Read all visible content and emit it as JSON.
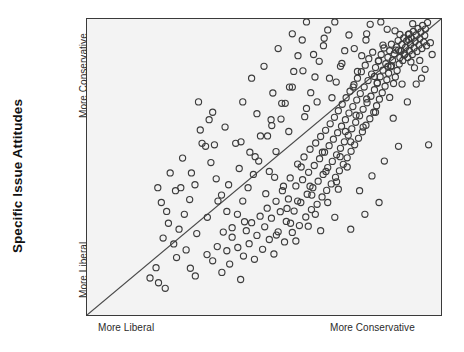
{
  "figure": {
    "background_color": "#ffffff",
    "plot_background_color": "#f3f3f3",
    "frame_color": "#3a3a3a"
  },
  "axes": {
    "y_title": "Specific Issue Attitudes",
    "y_tick_high": "More Conservative",
    "y_tick_low": "More Liberal",
    "x_tick_low": "More Liberal",
    "x_tick_high": "More Conservative"
  },
  "chart_data": {
    "type": "scatter",
    "title": "",
    "xlabel": "",
    "ylabel": "Specific Issue Attitudes",
    "xlim": [
      0,
      100
    ],
    "ylim": [
      0,
      100
    ],
    "grid": false,
    "legend": null,
    "xtick_labels": [
      "More Liberal",
      "More Conservative"
    ],
    "ytick_labels": [
      "More Liberal",
      "More Conservative"
    ],
    "marker": {
      "shape": "circle-open",
      "size_px": 6.2,
      "edge_color": "#3c3c3c",
      "face_color": "none",
      "edge_width_px": 1.15
    },
    "reference_line": {
      "name": "identity-diagonal",
      "x": [
        0,
        100
      ],
      "y": [
        0,
        100
      ],
      "color": "#4a4a4a",
      "width_px": 1.2,
      "style": "solid"
    },
    "annotations": [],
    "points": [
      [
        20.2,
        10.9
      ],
      [
        22.1,
        9.0
      ],
      [
        25.3,
        19.4
      ],
      [
        29.2,
        15.8
      ],
      [
        30.6,
        13.2
      ],
      [
        33.9,
        20.4
      ],
      [
        35.5,
        18.3
      ],
      [
        36.8,
        23.1
      ],
      [
        38.1,
        14.4
      ],
      [
        39.5,
        21.7
      ],
      [
        40.3,
        17.2
      ],
      [
        41.0,
        26.3
      ],
      [
        42.6,
        22.8
      ],
      [
        43.4,
        12.0
      ],
      [
        44.2,
        19.9
      ],
      [
        45.0,
        28.5
      ],
      [
        45.8,
        24.1
      ],
      [
        46.5,
        31.2
      ],
      [
        47.3,
        18.8
      ],
      [
        48.0,
        26.9
      ],
      [
        48.9,
        33.4
      ],
      [
        49.6,
        22.2
      ],
      [
        50.2,
        29.8
      ],
      [
        50.9,
        36.1
      ],
      [
        51.5,
        25.5
      ],
      [
        52.1,
        32.7
      ],
      [
        52.8,
        20.6
      ],
      [
        53.4,
        38.4
      ],
      [
        54.0,
        28.1
      ],
      [
        54.6,
        34.9
      ],
      [
        55.2,
        42.0
      ],
      [
        55.8,
        24.7
      ],
      [
        56.3,
        31.6
      ],
      [
        56.9,
        39.2
      ],
      [
        57.4,
        46.3
      ],
      [
        58.0,
        27.9
      ],
      [
        58.5,
        35.1
      ],
      [
        59.0,
        43.6
      ],
      [
        59.5,
        51.0
      ],
      [
        60.0,
        30.2
      ],
      [
        60.4,
        38.0
      ],
      [
        60.9,
        45.7
      ],
      [
        61.3,
        53.4
      ],
      [
        61.8,
        33.1
      ],
      [
        62.2,
        40.8
      ],
      [
        62.6,
        48.2
      ],
      [
        63.0,
        56.0
      ],
      [
        63.4,
        35.6
      ],
      [
        63.8,
        43.0
      ],
      [
        64.2,
        50.5
      ],
      [
        64.6,
        58.1
      ],
      [
        65.0,
        37.4
      ],
      [
        65.3,
        45.2
      ],
      [
        65.7,
        52.8
      ],
      [
        66.0,
        60.3
      ],
      [
        66.4,
        39.9
      ],
      [
        66.7,
        47.5
      ],
      [
        67.1,
        55.0
      ],
      [
        67.4,
        62.4
      ],
      [
        67.7,
        42.1
      ],
      [
        68.0,
        49.8
      ],
      [
        68.4,
        57.2
      ],
      [
        68.7,
        64.6
      ],
      [
        69.0,
        44.3
      ],
      [
        69.3,
        51.9
      ],
      [
        69.6,
        59.4
      ],
      [
        69.9,
        66.8
      ],
      [
        70.2,
        46.5
      ],
      [
        70.5,
        54.1
      ],
      [
        70.8,
        61.6
      ],
      [
        71.0,
        69.0
      ],
      [
        71.3,
        48.7
      ],
      [
        71.6,
        56.3
      ],
      [
        71.9,
        63.8
      ],
      [
        72.1,
        71.2
      ],
      [
        72.4,
        50.9
      ],
      [
        72.7,
        58.5
      ],
      [
        73.0,
        66.0
      ],
      [
        73.2,
        73.4
      ],
      [
        73.5,
        53.1
      ],
      [
        73.8,
        60.7
      ],
      [
        74.0,
        68.2
      ],
      [
        74.3,
        75.6
      ],
      [
        74.6,
        55.3
      ],
      [
        74.8,
        62.9
      ],
      [
        75.1,
        70.4
      ],
      [
        75.4,
        77.8
      ],
      [
        75.6,
        57.5
      ],
      [
        75.9,
        65.1
      ],
      [
        76.2,
        72.6
      ],
      [
        76.4,
        80.0
      ],
      [
        76.7,
        59.7
      ],
      [
        77.0,
        67.3
      ],
      [
        77.2,
        74.8
      ],
      [
        77.5,
        82.2
      ],
      [
        77.8,
        61.9
      ],
      [
        78.0,
        69.5
      ],
      [
        78.3,
        77.0
      ],
      [
        78.6,
        84.4
      ],
      [
        78.8,
        64.1
      ],
      [
        79.1,
        71.7
      ],
      [
        79.4,
        79.2
      ],
      [
        79.6,
        86.6
      ],
      [
        79.9,
        66.3
      ],
      [
        80.2,
        73.9
      ],
      [
        80.4,
        81.4
      ],
      [
        80.7,
        88.8
      ],
      [
        81.0,
        68.5
      ],
      [
        81.2,
        76.1
      ],
      [
        81.5,
        83.6
      ],
      [
        81.8,
        70.7
      ],
      [
        82.0,
        78.3
      ],
      [
        82.3,
        85.8
      ],
      [
        82.6,
        72.9
      ],
      [
        82.8,
        80.5
      ],
      [
        83.1,
        88.0
      ],
      [
        83.4,
        75.1
      ],
      [
        83.6,
        82.7
      ],
      [
        83.9,
        90.2
      ],
      [
        84.2,
        77.3
      ],
      [
        84.4,
        84.9
      ],
      [
        84.7,
        79.5
      ],
      [
        85.0,
        87.1
      ],
      [
        85.2,
        81.7
      ],
      [
        85.5,
        89.3
      ],
      [
        85.8,
        83.9
      ],
      [
        86.0,
        91.5
      ],
      [
        86.3,
        86.1
      ],
      [
        86.6,
        78.2
      ],
      [
        86.8,
        88.3
      ],
      [
        87.1,
        80.4
      ],
      [
        87.4,
        90.5
      ],
      [
        87.6,
        82.6
      ],
      [
        87.9,
        92.7
      ],
      [
        88.2,
        84.8
      ],
      [
        88.4,
        87.0
      ],
      [
        88.7,
        89.2
      ],
      [
        89.0,
        91.4
      ],
      [
        89.2,
        86.0
      ],
      [
        89.5,
        93.6
      ],
      [
        89.8,
        88.2
      ],
      [
        90.0,
        90.4
      ],
      [
        90.3,
        92.6
      ],
      [
        90.6,
        87.0
      ],
      [
        90.8,
        94.8
      ],
      [
        91.1,
        89.2
      ],
      [
        91.4,
        91.4
      ],
      [
        91.6,
        93.6
      ],
      [
        91.9,
        88.0
      ],
      [
        92.2,
        95.8
      ],
      [
        92.4,
        90.2
      ],
      [
        92.7,
        92.4
      ],
      [
        93.0,
        94.6
      ],
      [
        93.2,
        89.0
      ],
      [
        93.5,
        96.8
      ],
      [
        93.8,
        91.2
      ],
      [
        94.0,
        93.4
      ],
      [
        94.3,
        95.6
      ],
      [
        94.6,
        90.0
      ],
      [
        94.8,
        97.8
      ],
      [
        95.1,
        92.2
      ],
      [
        95.4,
        94.4
      ],
      [
        95.6,
        96.6
      ],
      [
        95.9,
        91.0
      ],
      [
        96.2,
        98.8
      ],
      [
        54.8,
        66.2
      ],
      [
        56.0,
        71.5
      ],
      [
        57.2,
        77.0
      ],
      [
        58.4,
        82.3
      ],
      [
        59.6,
        87.6
      ],
      [
        60.8,
        92.9
      ],
      [
        62.0,
        69.8
      ],
      [
        63.2,
        75.1
      ],
      [
        64.4,
        80.4
      ],
      [
        65.6,
        85.7
      ],
      [
        66.8,
        91.0
      ],
      [
        68.0,
        96.3
      ],
      [
        69.2,
        73.4
      ],
      [
        70.4,
        78.7
      ],
      [
        71.6,
        84.0
      ],
      [
        72.8,
        89.3
      ],
      [
        74.0,
        94.6
      ],
      [
        75.2,
        77.0
      ],
      [
        76.4,
        82.3
      ],
      [
        77.6,
        87.6
      ],
      [
        78.8,
        92.9
      ],
      [
        80.0,
        98.2
      ],
      [
        81.2,
        80.6
      ],
      [
        82.4,
        85.9
      ],
      [
        83.6,
        91.2
      ],
      [
        84.8,
        96.5
      ],
      [
        86.0,
        84.2
      ],
      [
        87.2,
        89.5
      ],
      [
        88.4,
        94.8
      ],
      [
        89.6,
        87.8
      ],
      [
        90.8,
        93.1
      ],
      [
        92.0,
        98.4
      ],
      [
        51.0,
        60.5
      ],
      [
        52.2,
        64.0
      ],
      [
        53.4,
        55.2
      ],
      [
        48.5,
        52.0
      ],
      [
        47.0,
        47.5
      ],
      [
        45.5,
        43.0
      ],
      [
        44.0,
        38.5
      ],
      [
        42.5,
        34.0
      ],
      [
        41.0,
        29.5
      ],
      [
        39.5,
        35.0
      ],
      [
        38.0,
        40.5
      ],
      [
        36.5,
        46.0
      ],
      [
        35.0,
        51.5
      ],
      [
        33.5,
        57.0
      ],
      [
        32.0,
        62.5
      ],
      [
        30.5,
        44.0
      ],
      [
        29.0,
        39.0
      ],
      [
        27.5,
        34.0
      ],
      [
        26.0,
        29.0
      ],
      [
        24.5,
        24.0
      ],
      [
        23.0,
        31.0
      ],
      [
        21.5,
        26.0
      ],
      [
        28.0,
        22.0
      ],
      [
        31.0,
        27.5
      ],
      [
        34.0,
        33.0
      ],
      [
        37.0,
        38.5
      ],
      [
        40.0,
        44.0
      ],
      [
        43.0,
        49.5
      ],
      [
        46.0,
        55.0
      ],
      [
        49.0,
        60.5
      ],
      [
        52.0,
        66.0
      ],
      [
        55.0,
        71.5
      ],
      [
        58.0,
        77.0
      ],
      [
        61.0,
        82.5
      ],
      [
        64.0,
        88.0
      ],
      [
        67.0,
        93.5
      ],
      [
        70.0,
        99.0
      ],
      [
        73.0,
        62.0
      ],
      [
        76.0,
        67.5
      ],
      [
        79.0,
        73.0
      ],
      [
        82.0,
        78.5
      ],
      [
        85.0,
        84.0
      ],
      [
        88.0,
        89.5
      ],
      [
        91.0,
        95.0
      ],
      [
        94.0,
        86.0
      ],
      [
        97.0,
        92.0
      ],
      [
        19.5,
        16.0
      ],
      [
        17.8,
        12.5
      ],
      [
        21.0,
        38.0
      ],
      [
        25.0,
        42.0
      ],
      [
        36.0,
        57.5
      ],
      [
        38.5,
        28.0
      ],
      [
        42.0,
        58.0
      ],
      [
        44.5,
        31.5
      ],
      [
        50.5,
        41.0
      ],
      [
        53.0,
        46.5
      ],
      [
        56.5,
        36.0
      ],
      [
        60.5,
        50.0
      ],
      [
        63.5,
        40.5
      ],
      [
        66.5,
        55.0
      ],
      [
        70.5,
        45.0
      ],
      [
        73.5,
        50.0
      ],
      [
        77.0,
        42.0
      ],
      [
        80.5,
        47.0
      ],
      [
        84.0,
        52.0
      ],
      [
        88.0,
        57.0
      ],
      [
        66.0,
        28.5
      ],
      [
        70.0,
        33.0
      ],
      [
        74.5,
        29.0
      ],
      [
        78.5,
        34.0
      ],
      [
        82.5,
        38.0
      ],
      [
        59.0,
        25.0
      ],
      [
        62.5,
        30.0
      ],
      [
        96.5,
        57.5
      ],
      [
        86.5,
        66.5
      ],
      [
        90.5,
        72.0
      ],
      [
        93.0,
        78.0
      ],
      [
        95.5,
        83.0
      ],
      [
        44.0,
        72.0
      ],
      [
        48.0,
        68.0
      ],
      [
        52.5,
        75.0
      ],
      [
        57.0,
        62.0
      ],
      [
        61.5,
        67.0
      ],
      [
        65.0,
        72.0
      ],
      [
        68.5,
        80.0
      ],
      [
        72.0,
        85.0
      ],
      [
        75.5,
        90.0
      ],
      [
        79.0,
        95.0
      ],
      [
        50.0,
        84.0
      ],
      [
        54.0,
        90.0
      ],
      [
        58.0,
        95.0
      ],
      [
        62.0,
        99.0
      ],
      [
        46.5,
        80.0
      ],
      [
        83.0,
        99.0
      ],
      [
        87.0,
        96.0
      ],
      [
        91.5,
        85.5
      ],
      [
        94.5,
        80.0
      ],
      [
        97.5,
        88.0
      ],
      [
        31.5,
        72.0
      ],
      [
        34.5,
        66.0
      ],
      [
        27.0,
        53.0
      ],
      [
        23.5,
        48.0
      ],
      [
        20.0,
        43.0
      ],
      [
        68.0,
        38.0
      ],
      [
        71.0,
        42.5
      ],
      [
        64.5,
        34.0
      ],
      [
        57.5,
        31.0
      ],
      [
        53.5,
        27.0
      ],
      [
        85.5,
        73.5
      ],
      [
        89.0,
        78.0
      ],
      [
        92.5,
        83.5
      ],
      [
        81.5,
        68.5
      ],
      [
        78.0,
        63.5
      ],
      [
        74.5,
        58.5
      ],
      [
        71.5,
        53.5
      ],
      [
        67.5,
        48.5
      ],
      [
        63.0,
        43.5
      ],
      [
        59.5,
        38.5
      ],
      [
        55.5,
        43.5
      ],
      [
        51.5,
        48.5
      ],
      [
        47.5,
        53.5
      ],
      [
        43.5,
        58.5
      ],
      [
        39.0,
        63.5
      ],
      [
        35.5,
        68.5
      ],
      [
        32.5,
        58.0
      ],
      [
        29.5,
        48.0
      ],
      [
        26.5,
        43.0
      ],
      [
        22.5,
        35.0
      ]
    ]
  }
}
